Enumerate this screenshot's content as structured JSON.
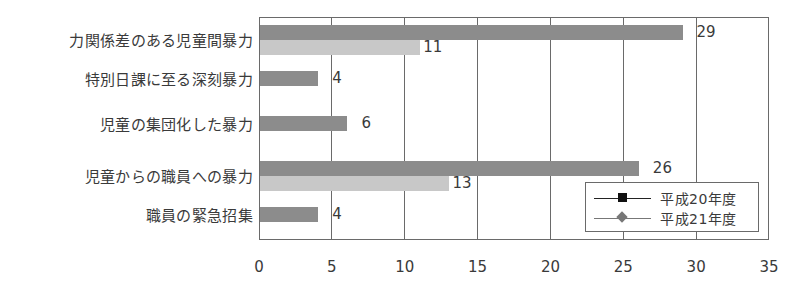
{
  "chart_data": {
    "type": "bar",
    "orientation": "horizontal",
    "title": "",
    "xlabel": "",
    "ylabel": "",
    "xlim": [
      0,
      35
    ],
    "x_ticks": [
      0,
      5,
      10,
      15,
      20,
      25,
      30,
      35
    ],
    "grid": true,
    "categories": [
      "力関係差のある児童間暴力",
      "特別日課に至る深刻暴力",
      "児童の集団化した暴力",
      "児童からの職員への暴力",
      "職員の緊急招集"
    ],
    "series": [
      {
        "name": "平成20年度",
        "values": [
          29,
          4,
          6,
          26,
          4
        ],
        "color": "#8c8c8c",
        "marker": "square"
      },
      {
        "name": "平成21年度",
        "values": [
          11,
          null,
          null,
          13,
          null
        ],
        "color": "#c8c8c8",
        "marker": "diamond"
      }
    ],
    "data_labels": [
      {
        "category": "力関係差のある児童間暴力",
        "series": "平成20年度",
        "label": "29"
      },
      {
        "category": "力関係差のある児童間暴力",
        "series": "平成21年度",
        "label": "11"
      },
      {
        "category": "特別日課に至る深刻暴力",
        "series": "平成20年度",
        "label": "4"
      },
      {
        "category": "児童の集団化した暴力",
        "series": "平成20年度",
        "label": "6"
      },
      {
        "category": "児童からの職員への暴力",
        "series": "平成20年度",
        "label": "26"
      },
      {
        "category": "児童からの職員への暴力",
        "series": "平成21年度",
        "label": "13"
      },
      {
        "category": "職員の緊急招集",
        "series": "平成20年度",
        "label": "4"
      }
    ],
    "legend": {
      "position": "lower-right-inside",
      "entries": [
        "平成20年度",
        "平成21年度"
      ]
    }
  }
}
